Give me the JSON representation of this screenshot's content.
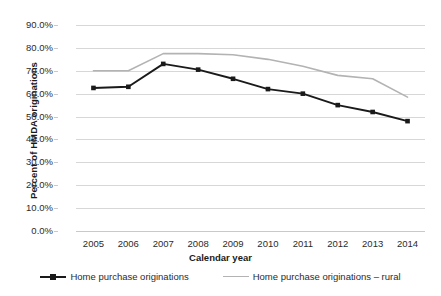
{
  "chart_data": {
    "type": "line",
    "title": "",
    "xlabel": "Calendar year",
    "ylabel": "Percent of HMDA originations",
    "x": [
      2005,
      2006,
      2007,
      2008,
      2009,
      2010,
      2011,
      2012,
      2013,
      2014
    ],
    "categories": [
      "2005",
      "2006",
      "2007",
      "2008",
      "2009",
      "2010",
      "2011",
      "2012",
      "2013",
      "2014"
    ],
    "ylim": [
      0,
      90
    ],
    "ytick_values": [
      90,
      80,
      70,
      60,
      50,
      40,
      30,
      20,
      10,
      0
    ],
    "ytick_labels": [
      "90.0%",
      "80.0%",
      "70.0%",
      "60.0%",
      "50.0%",
      "40.0%",
      "30.0%",
      "20.0%",
      "10.0%",
      "0.0%"
    ],
    "grid": true,
    "legend_position": "bottom",
    "series": [
      {
        "name": "Home purchase originations",
        "color": "#1a1a1a",
        "marker": "square",
        "values": [
          62.5,
          63.0,
          73.0,
          70.5,
          66.5,
          62.0,
          60.0,
          55.0,
          52.0,
          48.0
        ]
      },
      {
        "name": "Home purchase originations – rural",
        "color": "#b3b3b3",
        "marker": "none",
        "values": [
          70.0,
          70.0,
          77.5,
          77.5,
          77.0,
          75.0,
          72.0,
          68.0,
          66.5,
          58.5
        ]
      }
    ]
  },
  "legend": {
    "entries": [
      {
        "label": "Home purchase originations",
        "color": "#1a1a1a",
        "marker": "square"
      },
      {
        "label": "Home purchase originations – rural",
        "color": "#b3b3b3",
        "marker": "none"
      }
    ]
  },
  "colors": {
    "series_primary": "#1a1a1a",
    "series_secondary": "#b3b3b3",
    "gridline": "#d7d7d7",
    "text": "#2b2b2b",
    "background": "#ffffff"
  }
}
